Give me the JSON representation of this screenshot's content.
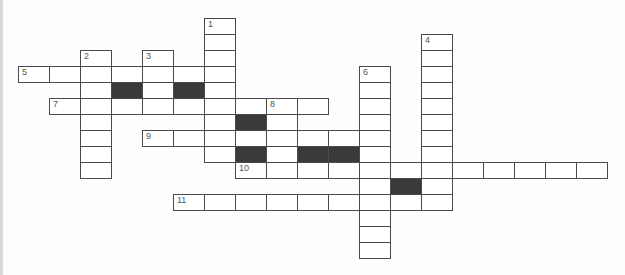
{
  "puzzle": {
    "title": "",
    "grid": {
      "origin_x": 18,
      "origin_y": 18,
      "cell_width": 31,
      "cell_height": 16,
      "cols": 19,
      "rows": 15,
      "colors": {
        "border": "#4a4a4a",
        "block": "#3a3a3a",
        "cell": "#ffffff",
        "number": "#555555"
      }
    },
    "cells": [
      {
        "r": 0,
        "c": 6,
        "num": "1"
      },
      {
        "r": 1,
        "c": 6
      },
      {
        "r": 1,
        "c": 13,
        "num": "4"
      },
      {
        "r": 2,
        "c": 2,
        "num": "2"
      },
      {
        "r": 2,
        "c": 4,
        "num": "3"
      },
      {
        "r": 2,
        "c": 6
      },
      {
        "r": 2,
        "c": 13
      },
      {
        "r": 3,
        "c": 0,
        "num": "5"
      },
      {
        "r": 3,
        "c": 1
      },
      {
        "r": 3,
        "c": 2
      },
      {
        "r": 3,
        "c": 3
      },
      {
        "r": 3,
        "c": 4
      },
      {
        "r": 3,
        "c": 5
      },
      {
        "r": 3,
        "c": 6
      },
      {
        "r": 3,
        "c": 11,
        "num": "6"
      },
      {
        "r": 3,
        "c": 13
      },
      {
        "r": 4,
        "c": 2
      },
      {
        "r": 4,
        "c": 3,
        "block": true
      },
      {
        "r": 4,
        "c": 4
      },
      {
        "r": 4,
        "c": 5,
        "block": true
      },
      {
        "r": 4,
        "c": 6
      },
      {
        "r": 4,
        "c": 11
      },
      {
        "r": 4,
        "c": 13
      },
      {
        "r": 5,
        "c": 1,
        "num": "7"
      },
      {
        "r": 5,
        "c": 2
      },
      {
        "r": 5,
        "c": 3
      },
      {
        "r": 5,
        "c": 4
      },
      {
        "r": 5,
        "c": 5
      },
      {
        "r": 5,
        "c": 6
      },
      {
        "r": 5,
        "c": 7
      },
      {
        "r": 5,
        "c": 8,
        "num": "8"
      },
      {
        "r": 5,
        "c": 9
      },
      {
        "r": 5,
        "c": 11
      },
      {
        "r": 5,
        "c": 13
      },
      {
        "r": 6,
        "c": 2
      },
      {
        "r": 6,
        "c": 6
      },
      {
        "r": 6,
        "c": 7,
        "block": true
      },
      {
        "r": 6,
        "c": 8
      },
      {
        "r": 6,
        "c": 11
      },
      {
        "r": 6,
        "c": 13
      },
      {
        "r": 7,
        "c": 2
      },
      {
        "r": 7,
        "c": 4,
        "num": "9"
      },
      {
        "r": 7,
        "c": 5
      },
      {
        "r": 7,
        "c": 6
      },
      {
        "r": 7,
        "c": 7
      },
      {
        "r": 7,
        "c": 8
      },
      {
        "r": 7,
        "c": 9
      },
      {
        "r": 7,
        "c": 10
      },
      {
        "r": 7,
        "c": 11
      },
      {
        "r": 7,
        "c": 13
      },
      {
        "r": 8,
        "c": 2
      },
      {
        "r": 8,
        "c": 6
      },
      {
        "r": 8,
        "c": 7,
        "block": true
      },
      {
        "r": 8,
        "c": 8
      },
      {
        "r": 8,
        "c": 9,
        "block": true
      },
      {
        "r": 8,
        "c": 10,
        "block": true
      },
      {
        "r": 8,
        "c": 11
      },
      {
        "r": 8,
        "c": 13
      },
      {
        "r": 9,
        "c": 2
      },
      {
        "r": 9,
        "c": 7,
        "num": "10"
      },
      {
        "r": 9,
        "c": 8
      },
      {
        "r": 9,
        "c": 9
      },
      {
        "r": 9,
        "c": 10
      },
      {
        "r": 9,
        "c": 11
      },
      {
        "r": 9,
        "c": 12
      },
      {
        "r": 9,
        "c": 13
      },
      {
        "r": 9,
        "c": 14
      },
      {
        "r": 9,
        "c": 15
      },
      {
        "r": 9,
        "c": 16
      },
      {
        "r": 9,
        "c": 17
      },
      {
        "r": 9,
        "c": 18
      },
      {
        "r": 10,
        "c": 11
      },
      {
        "r": 10,
        "c": 12,
        "block": true
      },
      {
        "r": 10,
        "c": 13
      },
      {
        "r": 11,
        "c": 5,
        "num": "11"
      },
      {
        "r": 11,
        "c": 6
      },
      {
        "r": 11,
        "c": 7
      },
      {
        "r": 11,
        "c": 8
      },
      {
        "r": 11,
        "c": 9
      },
      {
        "r": 11,
        "c": 10
      },
      {
        "r": 11,
        "c": 11
      },
      {
        "r": 11,
        "c": 12
      },
      {
        "r": 11,
        "c": 13
      },
      {
        "r": 12,
        "c": 11
      },
      {
        "r": 13,
        "c": 11
      },
      {
        "r": 14,
        "c": 11
      }
    ],
    "clue_numbers": [
      "1",
      "2",
      "3",
      "4",
      "5",
      "6",
      "7",
      "8",
      "9",
      "10",
      "11"
    ],
    "entries": {
      "across": [
        {
          "num": "5",
          "row": 3,
          "col": 0,
          "length": 7
        },
        {
          "num": "7",
          "row": 5,
          "col": 1,
          "length": 9
        },
        {
          "num": "9",
          "row": 7,
          "col": 4,
          "length": 8
        },
        {
          "num": "10",
          "row": 9,
          "col": 7,
          "length": 12
        },
        {
          "num": "11",
          "row": 11,
          "col": 5,
          "length": 9
        }
      ],
      "down": [
        {
          "num": "1",
          "row": 0,
          "col": 6,
          "length": 9
        },
        {
          "num": "2",
          "row": 2,
          "col": 2,
          "length": 8
        },
        {
          "num": "3",
          "row": 2,
          "col": 4,
          "length": 4
        },
        {
          "num": "4",
          "row": 1,
          "col": 13,
          "length": 11
        },
        {
          "num": "6",
          "row": 3,
          "col": 11,
          "length": 12
        },
        {
          "num": "8",
          "row": 5,
          "col": 8,
          "length": 5
        }
      ]
    }
  }
}
